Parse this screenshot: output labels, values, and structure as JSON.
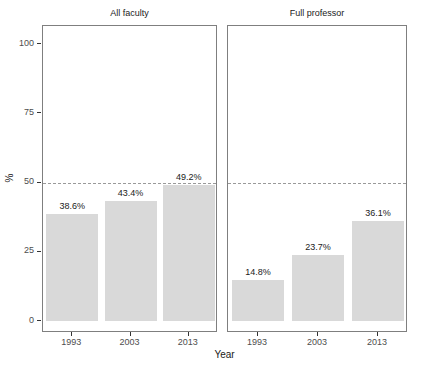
{
  "chart_data": {
    "type": "bar",
    "xlabel": "Year",
    "ylabel": "%",
    "ylim": [
      0,
      100
    ],
    "yticks": [
      0,
      25,
      50,
      75,
      100
    ],
    "grid": false,
    "legend": "none",
    "categories": [
      "1993",
      "2003",
      "2013"
    ],
    "facets": [
      {
        "title": "All faculty",
        "values": [
          38.6,
          43.4,
          49.2
        ],
        "value_labels": [
          "38.6%",
          "43.4%",
          "49.2%"
        ]
      },
      {
        "title": "Full professor",
        "values": [
          14.8,
          23.7,
          36.1
        ],
        "value_labels": [
          "14.8%",
          "23.7%",
          "36.1%"
        ]
      }
    ],
    "reference_line": {
      "y": 50,
      "style": "dashed",
      "color": "#999999"
    },
    "colors": {
      "bar_fill": "#D9D9D9",
      "panel_border": "#7F7F7F",
      "tick_mark": "#333333",
      "tick_label": "#4D4D4D",
      "text": "#1A1A1A",
      "background": "#FFFFFF"
    }
  }
}
